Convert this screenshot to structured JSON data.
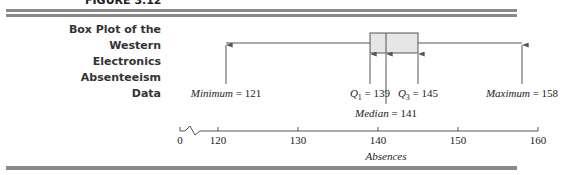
{
  "figure": {
    "label": "FIGURE 3.12",
    "title_lines": [
      "Box Plot of the Western",
      "Electronics Absenteeism",
      "Data"
    ]
  },
  "chart_data": {
    "type": "boxplot",
    "title": "Box Plot of the Western Electronics Absenteeism Data",
    "xlabel": "Absences",
    "ylabel": "",
    "xlim": [
      118,
      160
    ],
    "axis_break": {
      "from": 0,
      "to": 118
    },
    "ticks": [
      0,
      120,
      130,
      140,
      150,
      160
    ],
    "tick_labels": [
      "0",
      "120",
      "130",
      "140",
      "150",
      "160"
    ],
    "grid": false,
    "stats": {
      "min": 121,
      "q1": 139,
      "median": 141,
      "q3": 145,
      "max": 158
    },
    "annotations": [
      {
        "key": "min",
        "name": "Minimum",
        "sub": "",
        "value": 121,
        "row": 1
      },
      {
        "key": "q1",
        "name": "Q",
        "sub": "1",
        "value": 139,
        "row": 1
      },
      {
        "key": "median",
        "name": "Median",
        "sub": "",
        "value": 141,
        "row": 2
      },
      {
        "key": "q3",
        "name": "Q",
        "sub": "3",
        "value": 145,
        "row": 1
      },
      {
        "key": "max",
        "name": "Maximum",
        "sub": "",
        "value": 158,
        "row": 1
      }
    ],
    "colors": {
      "box_fill": "#e6e6e6",
      "line": "#555555",
      "rule": "#8a8a8a"
    }
  }
}
